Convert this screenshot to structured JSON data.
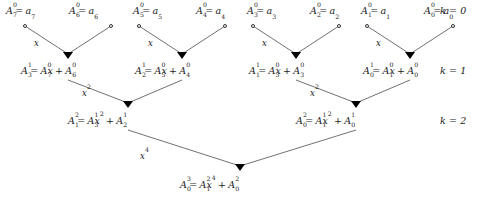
{
  "figure": {
    "type": "butterfly-diagram",
    "background": "#ffffff",
    "ink": "#1a1a1a"
  },
  "levels": [
    {
      "k_label": "k = 0",
      "terms": [
        {
          "lhs_base": "A",
          "lhs_sub": "7",
          "lhs_sup": "0",
          "rhs": "a",
          "rhs_sub": "7"
        },
        {
          "lhs_base": "A",
          "lhs_sub": "6",
          "lhs_sup": "0",
          "rhs": "a",
          "rhs_sub": "6"
        },
        {
          "lhs_base": "A",
          "lhs_sub": "5",
          "lhs_sup": "0",
          "rhs": "a",
          "rhs_sub": "5"
        },
        {
          "lhs_base": "A",
          "lhs_sub": "4",
          "lhs_sup": "0",
          "rhs": "a",
          "rhs_sub": "4"
        },
        {
          "lhs_base": "A",
          "lhs_sub": "3",
          "lhs_sup": "0",
          "rhs": "a",
          "rhs_sub": "3"
        },
        {
          "lhs_base": "A",
          "lhs_sub": "2",
          "lhs_sup": "0",
          "rhs": "a",
          "rhs_sub": "2"
        },
        {
          "lhs_base": "A",
          "lhs_sub": "1",
          "lhs_sup": "0",
          "rhs": "a",
          "rhs_sub": "1"
        },
        {
          "lhs_base": "A",
          "lhs_sub": "0",
          "lhs_sup": "0",
          "rhs": "a",
          "rhs_sub": "0"
        }
      ]
    },
    {
      "k_label": "k = 1",
      "terms": [
        {
          "lhs_base": "A",
          "lhs_sub": "3",
          "lhs_sup": "1",
          "t1_base": "A",
          "t1_sub": "7",
          "t1_sup": "0",
          "t1_mult": "x",
          "t2_base": "A",
          "t2_sub": "6",
          "t2_sup": "0"
        },
        {
          "lhs_base": "A",
          "lhs_sub": "2",
          "lhs_sup": "1",
          "t1_base": "A",
          "t1_sub": "5",
          "t1_sup": "0",
          "t1_mult": "x",
          "t2_base": "A",
          "t2_sub": "4",
          "t2_sup": "0"
        },
        {
          "lhs_base": "A",
          "lhs_sub": "1",
          "lhs_sup": "1",
          "t1_base": "A",
          "t1_sub": "3",
          "t1_sup": "0",
          "t1_mult": "x",
          "t2_base": "A",
          "t2_sub": "3",
          "t2_sup": "0"
        },
        {
          "lhs_base": "A",
          "lhs_sub": "0",
          "lhs_sup": "1",
          "t1_base": "A",
          "t1_sub": "1",
          "t1_sup": "0",
          "t1_mult": "x",
          "t2_base": "A",
          "t2_sub": "0",
          "t2_sup": "0"
        }
      ]
    },
    {
      "k_label": "k = 2",
      "terms": [
        {
          "lhs_base": "A",
          "lhs_sub": "1",
          "lhs_sup": "2",
          "t1_base": "A",
          "t1_sub": "3",
          "t1_sup": "1",
          "t1_mult": "x",
          "t1_mult_sup": "2",
          "t2_base": "A",
          "t2_sub": "2",
          "t2_sup": "1"
        },
        {
          "lhs_base": "A",
          "lhs_sub": "0",
          "lhs_sup": "2",
          "t1_base": "A",
          "t1_sub": "1",
          "t1_sup": "1",
          "t1_mult": "x",
          "t1_mult_sup": "2",
          "t2_base": "A",
          "t2_sub": "0",
          "t2_sup": "1"
        }
      ]
    },
    {
      "k_label": "",
      "terms": [
        {
          "lhs_base": "A",
          "lhs_sub": "0",
          "lhs_sup": "3",
          "t1_base": "A",
          "t1_sub": "1",
          "t1_sup": "2",
          "t1_mult": "x",
          "t1_mult_sup": "4",
          "t2_base": "A",
          "t2_sub": "0",
          "t2_sup": "2"
        }
      ]
    }
  ],
  "edge_labels": {
    "level0": [
      "x",
      "x",
      "x",
      "x"
    ],
    "level1": [
      "x",
      "x"
    ],
    "level1_sup": "2",
    "level2": [
      "x"
    ],
    "level2_sup": "4"
  },
  "operators": {
    "equals": "=",
    "plus": "+"
  }
}
